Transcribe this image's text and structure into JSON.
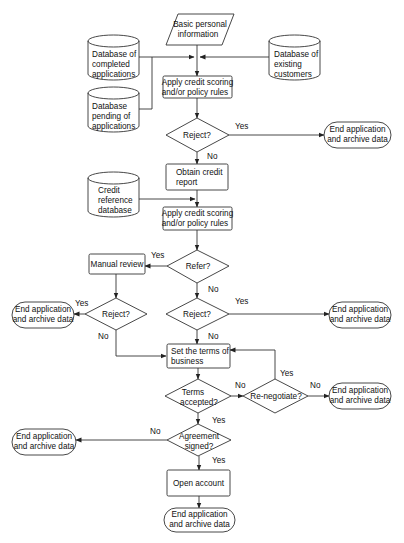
{
  "diagram": {
    "colors": {
      "stroke": "#333333",
      "fill": "#ffffff",
      "text": "#111111"
    },
    "nodes": {
      "input": {
        "shape": "parallelogram",
        "lines": [
          "Basic personal",
          "information"
        ]
      },
      "db_completed": {
        "shape": "cylinder",
        "lines": [
          "Database of",
          "completed",
          "applications"
        ]
      },
      "db_pending": {
        "shape": "cylinder",
        "lines": [
          "Database",
          "pending of",
          "applications"
        ]
      },
      "db_existing": {
        "shape": "cylinder",
        "lines": [
          "Database of",
          "existing",
          "customers"
        ]
      },
      "apply1": {
        "shape": "process",
        "lines": [
          "Apply credit scoring",
          "and/or policy rules"
        ]
      },
      "reject1": {
        "shape": "decision",
        "lines": [
          "Reject?"
        ]
      },
      "end1": {
        "shape": "terminator",
        "lines": [
          "End application",
          "and archive data"
        ]
      },
      "obtain": {
        "shape": "process",
        "lines": [
          "Obtain credit",
          "report"
        ]
      },
      "db_credit": {
        "shape": "cylinder",
        "lines": [
          "Credit",
          "reference",
          "database"
        ]
      },
      "apply2": {
        "shape": "process",
        "lines": [
          "Apply credit scoring",
          "and/or policy rules"
        ]
      },
      "refer": {
        "shape": "decision",
        "lines": [
          "Refer?"
        ]
      },
      "manual": {
        "shape": "process",
        "lines": [
          "Manual review"
        ]
      },
      "reject_left": {
        "shape": "decision",
        "lines": [
          "Reject?"
        ]
      },
      "end_left": {
        "shape": "terminator",
        "lines": [
          "End application",
          "and archive data"
        ]
      },
      "reject2": {
        "shape": "decision",
        "lines": [
          "Reject?"
        ]
      },
      "end2": {
        "shape": "terminator",
        "lines": [
          "End application",
          "and archive data"
        ]
      },
      "terms": {
        "shape": "process",
        "lines": [
          "Set the terms of",
          "business"
        ]
      },
      "accepted": {
        "shape": "decision",
        "lines": [
          "Terms",
          "accepted?"
        ]
      },
      "renegotiate": {
        "shape": "decision",
        "lines": [
          "Re-negotiate?"
        ]
      },
      "end3": {
        "shape": "terminator",
        "lines": [
          "End application",
          "and archive data"
        ]
      },
      "signed": {
        "shape": "decision",
        "lines": [
          "Agreement",
          "signed?"
        ]
      },
      "end4": {
        "shape": "terminator",
        "lines": [
          "End application",
          "and archive data"
        ]
      },
      "open": {
        "shape": "process",
        "lines": [
          "Open account"
        ]
      },
      "end_final": {
        "shape": "terminator",
        "lines": [
          "End application",
          "and archive data"
        ]
      }
    },
    "edge_labels": {
      "reject1_yes": "Yes",
      "reject1_no": "No",
      "refer_yes": "Yes",
      "refer_no": "No",
      "reject_left_yes": "Yes",
      "reject_left_no": "No",
      "reject2_yes": "Yes",
      "reject2_no": "No",
      "accepted_no": "No",
      "accepted_yes": "Yes",
      "renegotiate_yes": "Yes",
      "renegotiate_no": "No",
      "signed_no": "No",
      "signed_yes": "Yes"
    }
  }
}
